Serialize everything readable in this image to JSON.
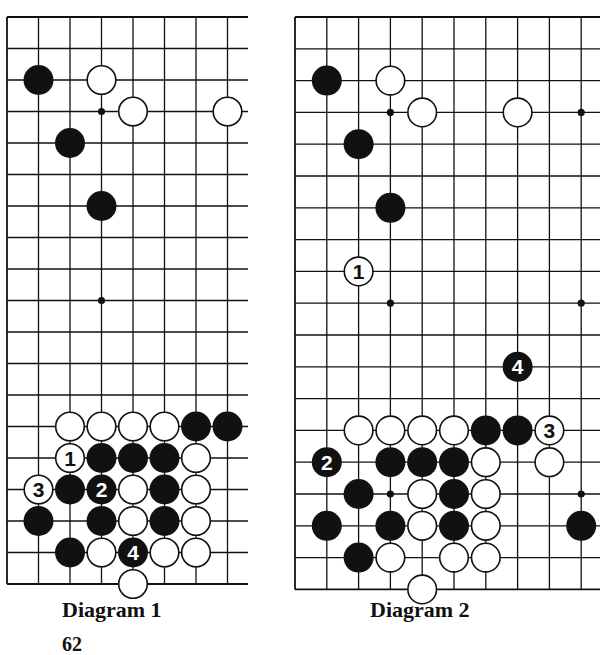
{
  "diagrams": [
    {
      "caption": "Diagram 1",
      "origin_x": 7,
      "origin_y": 17,
      "spacing": 31.5,
      "cols": 8,
      "rows": 19,
      "right_edge": 248,
      "stars": [
        [
          3,
          3
        ],
        [
          3,
          9
        ]
      ],
      "stones": [
        {
          "c": 1,
          "r": 2,
          "color": "black"
        },
        {
          "c": 3,
          "r": 2,
          "color": "white"
        },
        {
          "c": 4,
          "r": 3,
          "color": "white"
        },
        {
          "c": 7,
          "r": 3,
          "color": "white"
        },
        {
          "c": 2,
          "r": 4,
          "color": "black"
        },
        {
          "c": 3,
          "r": 6,
          "color": "black"
        },
        {
          "c": 2,
          "r": 13,
          "color": "white"
        },
        {
          "c": 3,
          "r": 13,
          "color": "white"
        },
        {
          "c": 4,
          "r": 13,
          "color": "white"
        },
        {
          "c": 5,
          "r": 13,
          "color": "white"
        },
        {
          "c": 6,
          "r": 13,
          "color": "black"
        },
        {
          "c": 7,
          "r": 13,
          "color": "black"
        },
        {
          "c": 2,
          "r": 14,
          "color": "white",
          "label": "1"
        },
        {
          "c": 3,
          "r": 14,
          "color": "black"
        },
        {
          "c": 4,
          "r": 14,
          "color": "black"
        },
        {
          "c": 5,
          "r": 14,
          "color": "black"
        },
        {
          "c": 6,
          "r": 14,
          "color": "white"
        },
        {
          "c": 1,
          "r": 15,
          "color": "white",
          "label": "3"
        },
        {
          "c": 2,
          "r": 15,
          "color": "black"
        },
        {
          "c": 3,
          "r": 15,
          "color": "black",
          "label": "2"
        },
        {
          "c": 4,
          "r": 15,
          "color": "white"
        },
        {
          "c": 5,
          "r": 15,
          "color": "black"
        },
        {
          "c": 6,
          "r": 15,
          "color": "white"
        },
        {
          "c": 1,
          "r": 16,
          "color": "black"
        },
        {
          "c": 3,
          "r": 16,
          "color": "black"
        },
        {
          "c": 4,
          "r": 16,
          "color": "white"
        },
        {
          "c": 5,
          "r": 16,
          "color": "black"
        },
        {
          "c": 6,
          "r": 16,
          "color": "white"
        },
        {
          "c": 2,
          "r": 17,
          "color": "black"
        },
        {
          "c": 3,
          "r": 17,
          "color": "white"
        },
        {
          "c": 4,
          "r": 17,
          "color": "black",
          "label": "4"
        },
        {
          "c": 5,
          "r": 17,
          "color": "white"
        },
        {
          "c": 6,
          "r": 17,
          "color": "white"
        },
        {
          "c": 4,
          "r": 18,
          "color": "white"
        }
      ]
    },
    {
      "caption": "Diagram 2",
      "origin_x": 295,
      "origin_y": 17,
      "spacing": 31.8,
      "cols": 10,
      "rows": 19,
      "right_edge": 600,
      "stars": [
        [
          3,
          3
        ],
        [
          9,
          3
        ],
        [
          3,
          9
        ],
        [
          9,
          9
        ],
        [
          3,
          15
        ],
        [
          9,
          15
        ]
      ],
      "stones": [
        {
          "c": 1,
          "r": 2,
          "color": "black"
        },
        {
          "c": 3,
          "r": 2,
          "color": "white"
        },
        {
          "c": 4,
          "r": 3,
          "color": "white"
        },
        {
          "c": 7,
          "r": 3,
          "color": "white"
        },
        {
          "c": 2,
          "r": 4,
          "color": "black"
        },
        {
          "c": 3,
          "r": 6,
          "color": "black"
        },
        {
          "c": 2,
          "r": 8,
          "color": "white",
          "label": "1"
        },
        {
          "c": 7,
          "r": 11,
          "color": "black",
          "label": "4"
        },
        {
          "c": 2,
          "r": 13,
          "color": "white"
        },
        {
          "c": 3,
          "r": 13,
          "color": "white"
        },
        {
          "c": 4,
          "r": 13,
          "color": "white"
        },
        {
          "c": 5,
          "r": 13,
          "color": "white"
        },
        {
          "c": 6,
          "r": 13,
          "color": "black"
        },
        {
          "c": 7,
          "r": 13,
          "color": "black"
        },
        {
          "c": 8,
          "r": 13,
          "color": "white",
          "label": "3"
        },
        {
          "c": 1,
          "r": 14,
          "color": "black",
          "label": "2"
        },
        {
          "c": 3,
          "r": 14,
          "color": "black"
        },
        {
          "c": 4,
          "r": 14,
          "color": "black"
        },
        {
          "c": 5,
          "r": 14,
          "color": "black"
        },
        {
          "c": 6,
          "r": 14,
          "color": "white"
        },
        {
          "c": 8,
          "r": 14,
          "color": "white"
        },
        {
          "c": 2,
          "r": 15,
          "color": "black"
        },
        {
          "c": 4,
          "r": 15,
          "color": "white"
        },
        {
          "c": 5,
          "r": 15,
          "color": "black"
        },
        {
          "c": 6,
          "r": 15,
          "color": "white"
        },
        {
          "c": 1,
          "r": 16,
          "color": "black"
        },
        {
          "c": 3,
          "r": 16,
          "color": "black"
        },
        {
          "c": 4,
          "r": 16,
          "color": "white"
        },
        {
          "c": 5,
          "r": 16,
          "color": "black"
        },
        {
          "c": 6,
          "r": 16,
          "color": "white"
        },
        {
          "c": 9,
          "r": 16,
          "color": "black"
        },
        {
          "c": 2,
          "r": 17,
          "color": "black"
        },
        {
          "c": 3,
          "r": 17,
          "color": "white"
        },
        {
          "c": 5,
          "r": 17,
          "color": "white"
        },
        {
          "c": 6,
          "r": 17,
          "color": "white"
        },
        {
          "c": 4,
          "r": 18,
          "color": "white"
        }
      ]
    }
  ],
  "page_number": "62"
}
